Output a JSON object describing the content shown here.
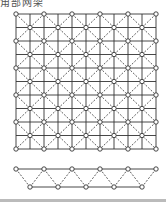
{
  "title": "角部网架",
  "plan": {
    "upper_x": [
      16,
      44,
      72,
      100,
      128,
      156
    ],
    "upper_y": [
      14,
      41,
      68,
      95,
      122,
      149
    ],
    "line_color": "#333333",
    "node_color": "#333333"
  },
  "elevation": {
    "top_y": 169,
    "bottom_y": 187,
    "top_x": [
      16,
      44,
      72,
      100,
      128,
      156
    ],
    "bottom_x": [
      30,
      58,
      86,
      114,
      142
    ]
  }
}
